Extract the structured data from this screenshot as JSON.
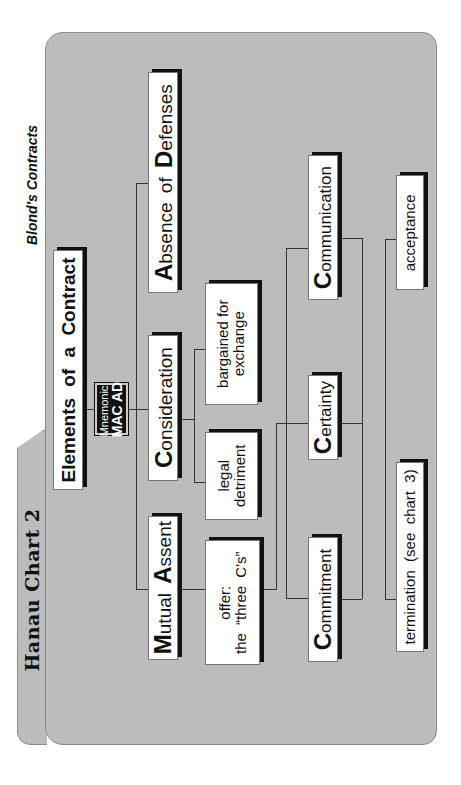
{
  "header": {
    "chart_label": "Hanau Chart 2",
    "source": "Blond's Contracts"
  },
  "root": {
    "title": "Elements of a Contract",
    "mnemonic_label": "Mnemonic:",
    "mnemonic_value": "MAC AD"
  },
  "elements": [
    {
      "initial": "M",
      "rest": "utual ",
      "initial2": "A",
      "rest2": "ssent",
      "full": "Mutual Assent"
    },
    {
      "initial": "C",
      "rest": "onsideration",
      "full": "Consideration"
    },
    {
      "initial": "A",
      "rest": "bsence of ",
      "initial2": "D",
      "rest2": "efenses",
      "full": "Absence of Defenses"
    }
  ],
  "mutual_assent_children": [
    {
      "line1": "offer:",
      "line2": "the “three C's”"
    }
  ],
  "consideration_children": [
    {
      "line1": "legal",
      "line2": "detriment"
    },
    {
      "line1": "bargained for",
      "line2": "exchange"
    }
  ],
  "three_cs": [
    {
      "initial": "C",
      "rest": "ommitment",
      "full": "Commitment"
    },
    {
      "initial": "C",
      "rest": "ertainty",
      "full": "Certainty"
    },
    {
      "initial": "C",
      "rest": "ommunication",
      "full": "Communication"
    }
  ],
  "communication_children": [
    {
      "label": "termination  (see  chart  3)"
    },
    {
      "label": "acceptance"
    }
  ],
  "colors": {
    "panel": "#bcbcbc",
    "box": "#ffffff",
    "shadow": "#111111",
    "mnemonic_bg": "#111111"
  }
}
